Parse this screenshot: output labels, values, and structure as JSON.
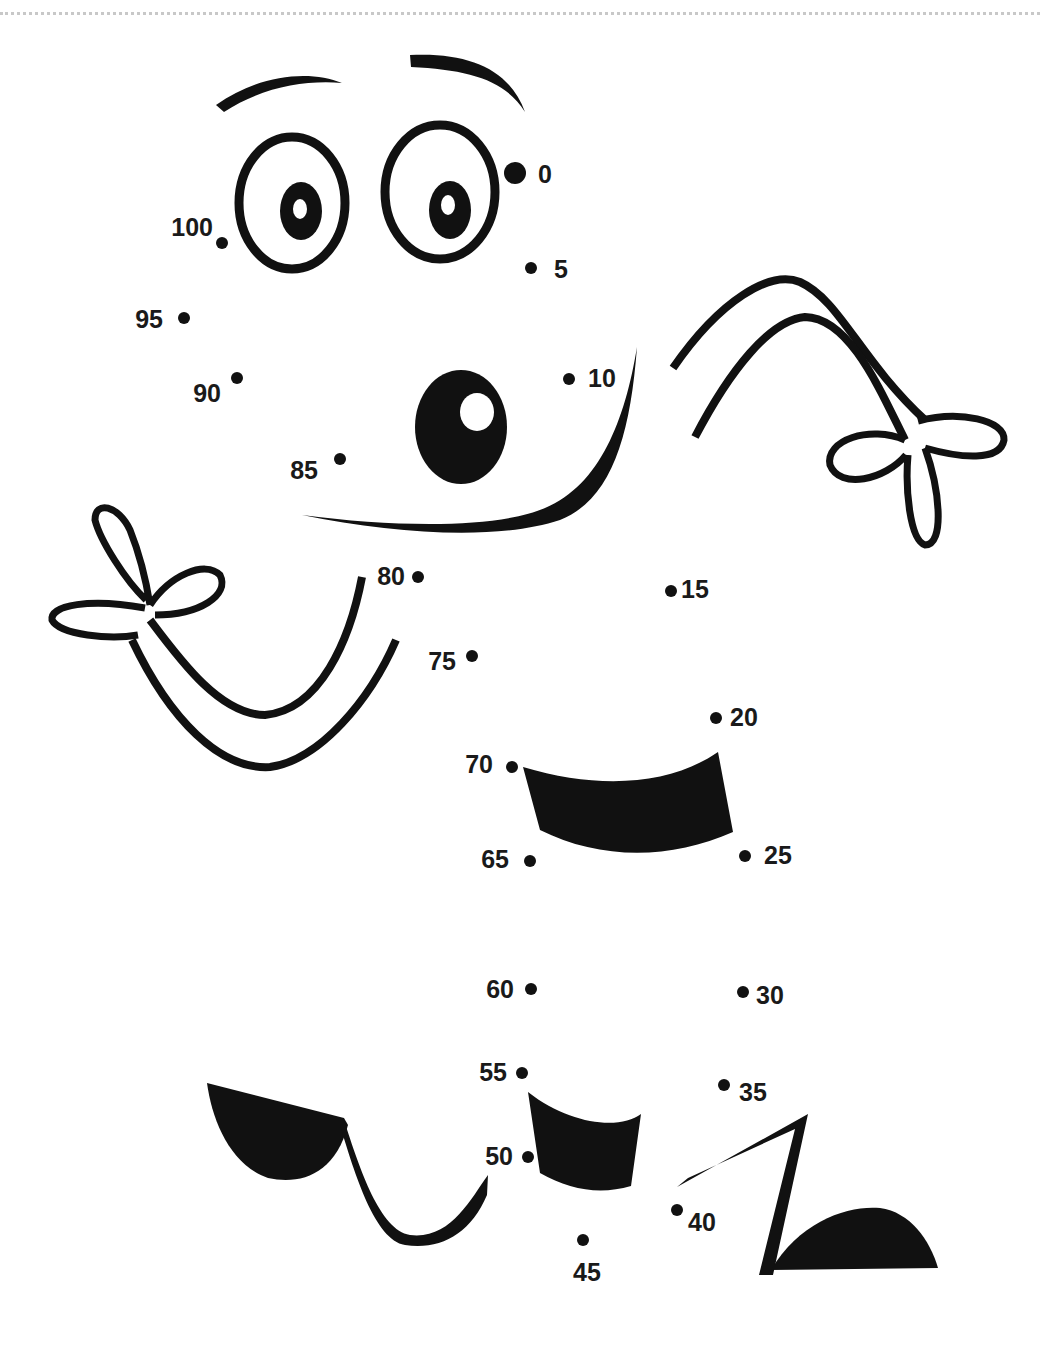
{
  "worksheet": {
    "type": "connect-the-dots",
    "ink_color": "#111111",
    "paper_color": "#ffffff",
    "cut_line_color": "#c8c8c8",
    "count_by": 5,
    "start": 0,
    "end": 100
  },
  "dots": [
    {
      "n": 0,
      "label": "0",
      "x": 515,
      "y": 173,
      "r": 11,
      "lx": 538,
      "ly": 183,
      "anchor": "start"
    },
    {
      "n": 5,
      "label": "5",
      "x": 531,
      "y": 268,
      "r": 6,
      "lx": 554,
      "ly": 278,
      "anchor": "start"
    },
    {
      "n": 10,
      "label": "10",
      "x": 569,
      "y": 379,
      "r": 6,
      "lx": 588,
      "ly": 387,
      "anchor": "start"
    },
    {
      "n": 15,
      "label": "15",
      "x": 671,
      "y": 591,
      "r": 6,
      "lx": 681,
      "ly": 598,
      "anchor": "start"
    },
    {
      "n": 20,
      "label": "20",
      "x": 716,
      "y": 718,
      "r": 6,
      "lx": 730,
      "ly": 726,
      "anchor": "start"
    },
    {
      "n": 25,
      "label": "25",
      "x": 745,
      "y": 856,
      "r": 6,
      "lx": 764,
      "ly": 864,
      "anchor": "start"
    },
    {
      "n": 30,
      "label": "30",
      "x": 743,
      "y": 992,
      "r": 6,
      "lx": 756,
      "ly": 1004,
      "anchor": "start"
    },
    {
      "n": 35,
      "label": "35",
      "x": 724,
      "y": 1085,
      "r": 6,
      "lx": 739,
      "ly": 1101,
      "anchor": "start"
    },
    {
      "n": 40,
      "label": "40",
      "x": 677,
      "y": 1210,
      "r": 6,
      "lx": 688,
      "ly": 1231,
      "anchor": "start"
    },
    {
      "n": 45,
      "label": "45",
      "x": 583,
      "y": 1240,
      "r": 6,
      "lx": 587,
      "ly": 1281,
      "anchor": "middle"
    },
    {
      "n": 50,
      "label": "50",
      "x": 528,
      "y": 1157,
      "r": 6,
      "lx": 513,
      "ly": 1165,
      "anchor": "end"
    },
    {
      "n": 55,
      "label": "55",
      "x": 522,
      "y": 1073,
      "r": 6,
      "lx": 507,
      "ly": 1081,
      "anchor": "end"
    },
    {
      "n": 60,
      "label": "60",
      "x": 531,
      "y": 989,
      "r": 6,
      "lx": 514,
      "ly": 998,
      "anchor": "end"
    },
    {
      "n": 65,
      "label": "65",
      "x": 530,
      "y": 861,
      "r": 6,
      "lx": 509,
      "ly": 868,
      "anchor": "end"
    },
    {
      "n": 70,
      "label": "70",
      "x": 512,
      "y": 767,
      "r": 6,
      "lx": 493,
      "ly": 773,
      "anchor": "end"
    },
    {
      "n": 75,
      "label": "75",
      "x": 472,
      "y": 656,
      "r": 6,
      "lx": 456,
      "ly": 670,
      "anchor": "end"
    },
    {
      "n": 80,
      "label": "80",
      "x": 418,
      "y": 577,
      "r": 6,
      "lx": 405,
      "ly": 585,
      "anchor": "end"
    },
    {
      "n": 85,
      "label": "85",
      "x": 340,
      "y": 459,
      "r": 6,
      "lx": 318,
      "ly": 479,
      "anchor": "end"
    },
    {
      "n": 90,
      "label": "90",
      "x": 237,
      "y": 378,
      "r": 6,
      "lx": 221,
      "ly": 402,
      "anchor": "end"
    },
    {
      "n": 95,
      "label": "95",
      "x": 184,
      "y": 318,
      "r": 6,
      "lx": 163,
      "ly": 328,
      "anchor": "end"
    },
    {
      "n": 100,
      "label": "100",
      "x": 222,
      "y": 243,
      "r": 6,
      "lx": 213,
      "ly": 236,
      "anchor": "end"
    }
  ],
  "drawing_parts": [
    "left-eyebrow",
    "right-eyebrow",
    "left-eye",
    "right-eye",
    "nose",
    "smile",
    "right-arm",
    "right-hand",
    "left-arm",
    "left-hand",
    "upper-body-stripe",
    "lower-body-stripe",
    "left-foot",
    "right-foot"
  ]
}
